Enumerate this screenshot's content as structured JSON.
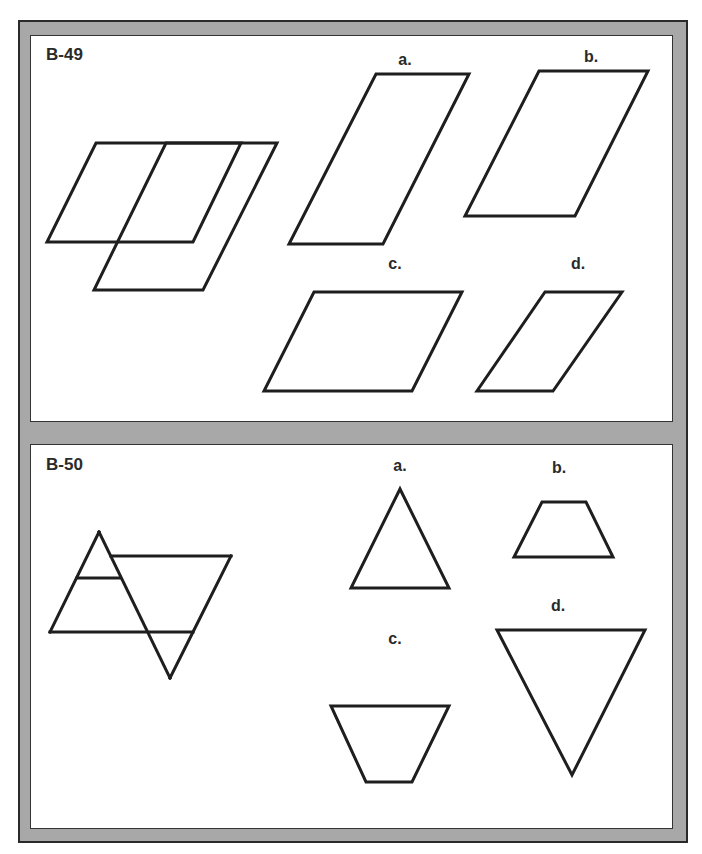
{
  "page": {
    "frame_color": "#a8a8a8",
    "line_color": "#1e1e1e"
  },
  "problems": [
    {
      "id": "B-49",
      "label": "B-49",
      "figure": {
        "description": "Two overlapping parallelograms sharing a top edge line",
        "shapes": [
          {
            "name": "parallelogram-1",
            "points": [
              [
                96,
                143
              ],
              [
                241,
                143
              ],
              [
                193,
                242
              ],
              [
                47,
                242
              ]
            ]
          },
          {
            "name": "parallelogram-2",
            "points": [
              [
                166,
                143
              ],
              [
                277,
                143
              ],
              [
                203,
                290
              ],
              [
                94,
                290
              ]
            ]
          }
        ]
      },
      "options": [
        {
          "label": "a.",
          "label_pos": [
            405,
            53
          ],
          "shape": "parallelogram",
          "points": [
            [
              376,
              74
            ],
            [
              469,
              74
            ],
            [
              383,
              244
            ],
            [
              289,
              244
            ]
          ]
        },
        {
          "label": "b.",
          "label_pos": [
            591,
            50
          ],
          "shape": "parallelogram",
          "points": [
            [
              539,
              71
            ],
            [
              648,
              71
            ],
            [
              575,
              216
            ],
            [
              465,
              216
            ]
          ]
        },
        {
          "label": "c.",
          "label_pos": [
            395,
            257
          ],
          "shape": "parallelogram",
          "points": [
            [
              314,
              292
            ],
            [
              462,
              292
            ],
            [
              412,
              391
            ],
            [
              264,
              391
            ]
          ]
        },
        {
          "label": "d.",
          "label_pos": [
            578,
            257
          ],
          "shape": "parallelogram",
          "points": [
            [
              545,
              292
            ],
            [
              622,
              292
            ],
            [
              553,
              391
            ],
            [
              477,
              391
            ]
          ]
        }
      ]
    },
    {
      "id": "B-50",
      "label": "B-50",
      "figure": {
        "description": "Upward triangle overlapping a downward-pointing trapezoid/triangle shape",
        "lines": [
          {
            "name": "triangle-left-side",
            "points": [
              [
                99,
                532
              ],
              [
                50,
                632
              ]
            ]
          },
          {
            "name": "triangle-right-side",
            "points": [
              [
                99,
                532
              ],
              [
                170,
                678
              ]
            ]
          },
          {
            "name": "base-line",
            "points": [
              [
                50,
                632
              ],
              [
                193,
                632
              ]
            ]
          },
          {
            "name": "down-right-side",
            "points": [
              [
                193,
                632
              ],
              [
                231,
                556
              ]
            ]
          },
          {
            "name": "top-line",
            "points": [
              [
                231,
                556
              ],
              [
                111,
                556
              ]
            ]
          },
          {
            "name": "lower-right-side",
            "points": [
              [
                193,
                632
              ],
              [
                170,
                678
              ]
            ]
          },
          {
            "name": "middle-crossbar",
            "points": [
              [
                77,
                578
              ],
              [
                120,
                578
              ]
            ]
          }
        ]
      },
      "options": [
        {
          "label": "a.",
          "label_pos": [
            400,
            458
          ],
          "shape": "triangle-up",
          "points": [
            [
              400,
              489
            ],
            [
              351,
              588
            ],
            [
              449,
              588
            ]
          ]
        },
        {
          "label": "b.",
          "label_pos": [
            559,
            461
          ],
          "shape": "trapezoid",
          "points": [
            [
              542,
              502
            ],
            [
              586,
              502
            ],
            [
              613,
              557
            ],
            [
              514,
              557
            ]
          ]
        },
        {
          "label": "c.",
          "label_pos": [
            395,
            632
          ],
          "shape": "inverted-trapezoid",
          "points": [
            [
              331,
              706
            ],
            [
              449,
              706
            ],
            [
              412,
              782
            ],
            [
              366,
              782
            ]
          ]
        },
        {
          "label": "d.",
          "label_pos": [
            558,
            598
          ],
          "shape": "triangle-down",
          "points": [
            [
              497,
              630
            ],
            [
              645,
              630
            ],
            [
              572,
              775
            ]
          ]
        }
      ]
    }
  ]
}
